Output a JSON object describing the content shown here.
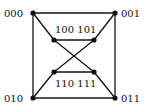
{
  "diagram": {
    "nodes": [
      {
        "id": "000",
        "label": "000",
        "x": 33,
        "y": 13,
        "label_x": 4,
        "label_y": 17
      },
      {
        "id": "001",
        "label": "001",
        "x": 115,
        "y": 13,
        "label_x": 121,
        "label_y": 17
      },
      {
        "id": "010",
        "label": "010",
        "x": 33,
        "y": 98,
        "label_x": 4,
        "label_y": 102
      },
      {
        "id": "011",
        "label": "011",
        "x": 115,
        "y": 98,
        "label_x": 121,
        "label_y": 102
      },
      {
        "id": "100",
        "label": "100",
        "x": 54,
        "y": 40
      },
      {
        "id": "101",
        "label": "101",
        "x": 94,
        "y": 40
      },
      {
        "id": "110",
        "label": "110",
        "x": 54,
        "y": 72
      },
      {
        "id": "111",
        "label": "111",
        "x": 94,
        "y": 72
      }
    ],
    "inner_labels": {
      "top": "100 101",
      "bottom": "110 111"
    },
    "edges": [
      [
        "000",
        "001"
      ],
      [
        "000",
        "010"
      ],
      [
        "001",
        "011"
      ],
      [
        "010",
        "011"
      ],
      [
        "000",
        "100"
      ],
      [
        "001",
        "101"
      ],
      [
        "010",
        "110"
      ],
      [
        "011",
        "111"
      ],
      [
        "100",
        "101"
      ],
      [
        "110",
        "111"
      ],
      [
        "100",
        "111"
      ],
      [
        "101",
        "110"
      ]
    ],
    "colors": {
      "edge": "#111111",
      "node": "#111111",
      "background": "#ffffff"
    }
  }
}
